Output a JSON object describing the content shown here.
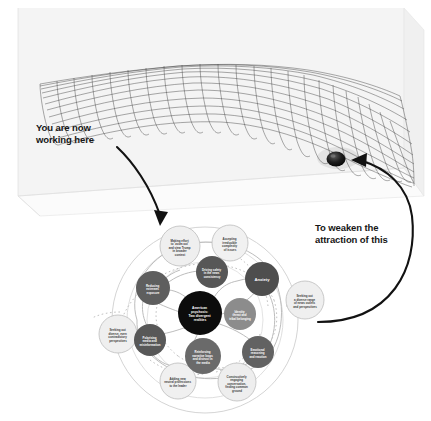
{
  "figure": {
    "background_color": "#ffffff"
  },
  "annotations": {
    "left_callout": "You are now\nworking here",
    "right_callout": "To weaken the\nattraction of this"
  },
  "landscape": {
    "box_fill": "#f2f2f2",
    "box_stroke": "#d7d7d7",
    "mesh_color": "#2b2b2b",
    "ball_color": "#111111",
    "arrow_color": "#111111",
    "ball_label": "attractor-ball"
  },
  "diagram": {
    "center_color": "#0d0d0d",
    "dark_node_color": "#4a4a4a",
    "mid_node_color": "#6e6e6e",
    "light_node_color": "#ededed",
    "light_node_stroke": "#b9b9b9",
    "link_color": "#b0b0b0",
    "dotted_link_color": "#c4c4c4",
    "ring_color": "#c9c9c9",
    "center": {
      "id": "american-psychosis",
      "label": "American\npsychosis:\nTwo divergent\nrealities"
    },
    "inner_nodes": [
      {
        "id": "anxiety",
        "label": "Anxiety",
        "tone": "dark"
      },
      {
        "id": "driving-safety-in-the-news-consistency",
        "label": "Driving safety\nin the news\nconsistency",
        "tone": "dark"
      },
      {
        "id": "reducing-extremes-exposure",
        "label": "Reducing\nextremes\nexposure",
        "tone": "dark"
      },
      {
        "id": "polarising-media-information",
        "label": "Polarising\nmedia and\nmisinformation",
        "tone": "dark"
      },
      {
        "id": "emotional-reasoning",
        "label": "Emotional\nreasoning\nand reaction",
        "tone": "mid"
      },
      {
        "id": "identity-threat",
        "label": "Identity\nthreat and\ntribal belonging",
        "tone": "mid"
      },
      {
        "id": "reinforcing-narrative-loops",
        "label": "Reinforcing\nnarrative loops\nand distrust in\nthe media",
        "tone": "mid"
      },
      {
        "id": "uncertainty",
        "label": "Uncertainty",
        "tone": "mid"
      }
    ],
    "outer_nodes": [
      {
        "id": "zoom-out-broader-context",
        "label": "Making effort\nto 'zoom out'\nand view Trump\nin broader\ncontext"
      },
      {
        "id": "accepting-complexity",
        "label": "Accepting\nirreducible\ncomplexity\nof issues"
      },
      {
        "id": "diverse-news-outlets",
        "label": "Seeking out\na diverse range\nof news outlets\nand perspectives"
      },
      {
        "id": "constructive-dialogue",
        "label": "Constructive\nengaging\nconversation,\nfinding common\nground"
      },
      {
        "id": "adding-new-neutral-professions",
        "label": "Adding new\nneutral professions\nto the leader"
      },
      {
        "id": "seeking-contradictory-perspectives",
        "label": "Seeking out\ndiverse, even\ncontradictory\nperspectives"
      }
    ]
  }
}
